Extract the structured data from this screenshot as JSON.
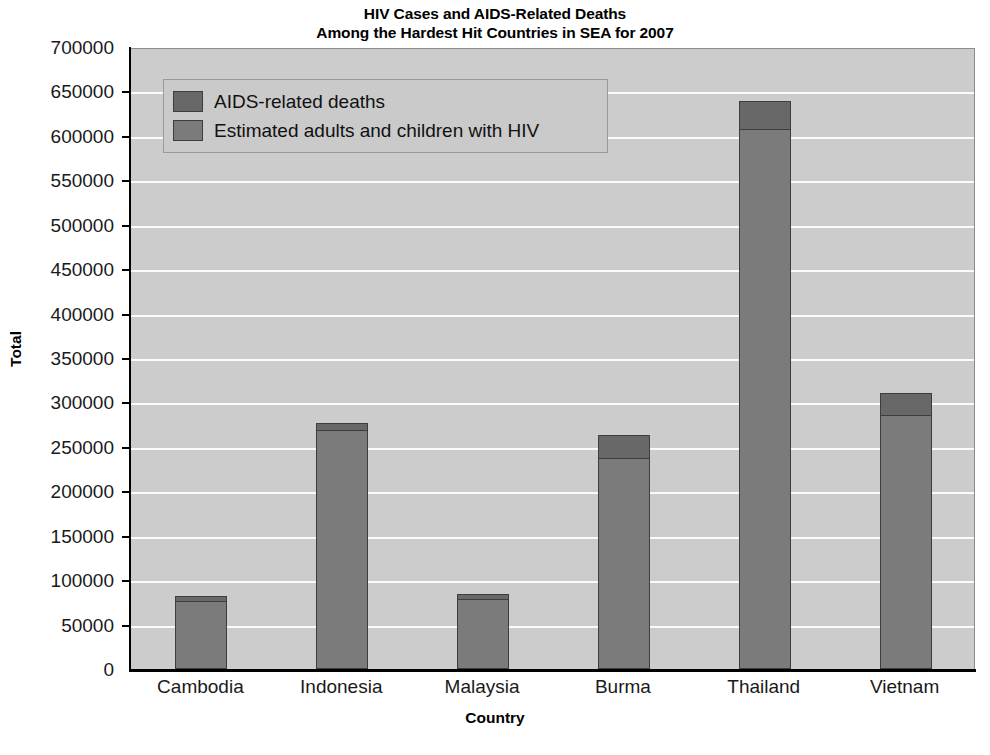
{
  "chart_data": {
    "type": "bar",
    "stacked": true,
    "title": "HIV Cases and AIDS-Related Deaths Among the Hardest Hit Countries in SEA for 2007",
    "title_line1": "HIV Cases and AIDS-Related Deaths",
    "title_line2": "Among the Hardest Hit Countries in SEA for 2007",
    "xlabel": "Country",
    "ylabel": "Total",
    "categories": [
      "Cambodia",
      "Indonesia",
      "Malaysia",
      "Burma",
      "Thailand",
      "Vietnam"
    ],
    "series": [
      {
        "name": "Estimated adults and children with HIV",
        "color": "#7b7b7b",
        "values": [
          76000,
          269000,
          79000,
          238000,
          608000,
          286000
        ]
      },
      {
        "name": "AIDS-related deaths",
        "color": "#686868",
        "values": [
          6000,
          8000,
          5000,
          25000,
          31000,
          25000
        ]
      }
    ],
    "totals": [
      82000,
      277000,
      84000,
      263000,
      639000,
      311000
    ],
    "ylim": [
      0,
      700000
    ],
    "ytick_step": 50000,
    "yticks": [
      "700000",
      "650000",
      "600000",
      "550000",
      "500000",
      "450000",
      "400000",
      "350000",
      "300000",
      "250000",
      "200000",
      "150000",
      "100000",
      "50000",
      "0"
    ],
    "ytick_values": [
      700000,
      650000,
      600000,
      550000,
      500000,
      450000,
      400000,
      350000,
      300000,
      250000,
      200000,
      150000,
      100000,
      50000,
      0
    ],
    "grid": true,
    "grid_axis": "y",
    "legend_position": "top-left",
    "legend_entries": [
      {
        "label": "AIDS-related deaths",
        "color": "#686868"
      },
      {
        "label": "Estimated adults and children with HIV",
        "color": "#7b7b7b"
      }
    ],
    "plot_background": "#cccccc",
    "gridline_color": "#fbfbfb",
    "axis_color": "#000000"
  }
}
